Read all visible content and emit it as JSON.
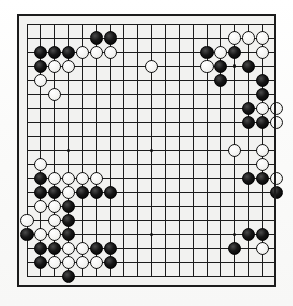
{
  "app": {
    "title": "Go Board Position",
    "board_type": "go-goban",
    "size": 19,
    "background_color": "#f2f2f0",
    "line_color": "#1c1c1c",
    "border_color": "#1c1c1c",
    "black_stone_color": "#000000",
    "white_stone_color": "#fbfbf9"
  },
  "geometry": {
    "board_left": 17,
    "board_top": 14,
    "board_width": 259,
    "board_height": 273,
    "origin_x": 10,
    "origin_y": 10,
    "cell_w": 13.85,
    "cell_h": 14.05,
    "stone_diameter": 13.2
  },
  "board": {
    "columns": 19,
    "rows": 19,
    "star_points": [
      {
        "col": 4,
        "row": 4
      },
      {
        "col": 10,
        "row": 4
      },
      {
        "col": 16,
        "row": 4
      },
      {
        "col": 4,
        "row": 10
      },
      {
        "col": 10,
        "row": 10
      },
      {
        "col": 16,
        "row": 10
      },
      {
        "col": 4,
        "row": 16
      },
      {
        "col": 10,
        "row": 16
      },
      {
        "col": 16,
        "row": 16
      }
    ],
    "stones": [
      {
        "col": 6,
        "row": 2,
        "color": "black"
      },
      {
        "col": 7,
        "row": 2,
        "color": "black"
      },
      {
        "col": 16,
        "row": 2,
        "color": "white"
      },
      {
        "col": 17,
        "row": 2,
        "color": "white"
      },
      {
        "col": 18,
        "row": 2,
        "color": "white"
      },
      {
        "col": 2,
        "row": 3,
        "color": "black"
      },
      {
        "col": 3,
        "row": 3,
        "color": "black"
      },
      {
        "col": 4,
        "row": 3,
        "color": "black"
      },
      {
        "col": 5,
        "row": 3,
        "color": "white"
      },
      {
        "col": 6,
        "row": 3,
        "color": "white"
      },
      {
        "col": 7,
        "row": 3,
        "color": "white"
      },
      {
        "col": 14,
        "row": 3,
        "color": "black"
      },
      {
        "col": 15,
        "row": 3,
        "color": "white"
      },
      {
        "col": 16,
        "row": 3,
        "color": "black"
      },
      {
        "col": 18,
        "row": 3,
        "color": "white"
      },
      {
        "col": 2,
        "row": 4,
        "color": "black"
      },
      {
        "col": 3,
        "row": 4,
        "color": "white"
      },
      {
        "col": 4,
        "row": 4,
        "color": "white"
      },
      {
        "col": 10,
        "row": 4,
        "color": "white"
      },
      {
        "col": 14,
        "row": 4,
        "color": "white"
      },
      {
        "col": 15,
        "row": 4,
        "color": "black"
      },
      {
        "col": 17,
        "row": 4,
        "color": "black"
      },
      {
        "col": 2,
        "row": 5,
        "color": "white"
      },
      {
        "col": 15,
        "row": 5,
        "color": "black"
      },
      {
        "col": 18,
        "row": 5,
        "color": "black"
      },
      {
        "col": 3,
        "row": 6,
        "color": "white"
      },
      {
        "col": 18,
        "row": 6,
        "color": "black"
      },
      {
        "col": 17,
        "row": 7,
        "color": "black"
      },
      {
        "col": 18,
        "row": 7,
        "color": "white"
      },
      {
        "col": 19,
        "row": 7,
        "color": "white"
      },
      {
        "col": 17,
        "row": 8,
        "color": "black"
      },
      {
        "col": 18,
        "row": 8,
        "color": "black"
      },
      {
        "col": 19,
        "row": 8,
        "color": "white"
      },
      {
        "col": 16,
        "row": 10,
        "color": "white"
      },
      {
        "col": 18,
        "row": 10,
        "color": "white"
      },
      {
        "col": 18,
        "row": 11,
        "color": "white"
      },
      {
        "col": 2,
        "row": 11,
        "color": "white"
      },
      {
        "col": 2,
        "row": 12,
        "color": "black"
      },
      {
        "col": 3,
        "row": 12,
        "color": "white"
      },
      {
        "col": 4,
        "row": 12,
        "color": "white"
      },
      {
        "col": 5,
        "row": 12,
        "color": "white"
      },
      {
        "col": 6,
        "row": 12,
        "color": "white"
      },
      {
        "col": 17,
        "row": 12,
        "color": "black"
      },
      {
        "col": 18,
        "row": 12,
        "color": "black"
      },
      {
        "col": 19,
        "row": 12,
        "color": "white"
      },
      {
        "col": 2,
        "row": 13,
        "color": "black"
      },
      {
        "col": 3,
        "row": 13,
        "color": "black"
      },
      {
        "col": 4,
        "row": 13,
        "color": "white"
      },
      {
        "col": 5,
        "row": 13,
        "color": "black"
      },
      {
        "col": 6,
        "row": 13,
        "color": "black"
      },
      {
        "col": 7,
        "row": 13,
        "color": "black"
      },
      {
        "col": 19,
        "row": 13,
        "color": "black"
      },
      {
        "col": 2,
        "row": 14,
        "color": "white"
      },
      {
        "col": 3,
        "row": 14,
        "color": "white"
      },
      {
        "col": 4,
        "row": 14,
        "color": "black"
      },
      {
        "col": 1,
        "row": 15,
        "color": "white"
      },
      {
        "col": 3,
        "row": 15,
        "color": "white"
      },
      {
        "col": 4,
        "row": 15,
        "color": "black"
      },
      {
        "col": 1,
        "row": 16,
        "color": "black"
      },
      {
        "col": 2,
        "row": 16,
        "color": "white"
      },
      {
        "col": 3,
        "row": 16,
        "color": "white"
      },
      {
        "col": 4,
        "row": 16,
        "color": "black"
      },
      {
        "col": 17,
        "row": 16,
        "color": "black"
      },
      {
        "col": 18,
        "row": 16,
        "color": "black"
      },
      {
        "col": 2,
        "row": 17,
        "color": "black"
      },
      {
        "col": 3,
        "row": 17,
        "color": "black"
      },
      {
        "col": 4,
        "row": 17,
        "color": "white"
      },
      {
        "col": 5,
        "row": 17,
        "color": "white"
      },
      {
        "col": 6,
        "row": 17,
        "color": "black"
      },
      {
        "col": 7,
        "row": 17,
        "color": "black"
      },
      {
        "col": 16,
        "row": 17,
        "color": "black"
      },
      {
        "col": 18,
        "row": 17,
        "color": "white"
      },
      {
        "col": 2,
        "row": 18,
        "color": "black"
      },
      {
        "col": 3,
        "row": 18,
        "color": "white"
      },
      {
        "col": 4,
        "row": 18,
        "color": "white"
      },
      {
        "col": 5,
        "row": 18,
        "color": "white"
      },
      {
        "col": 6,
        "row": 18,
        "color": "white"
      },
      {
        "col": 7,
        "row": 18,
        "color": "black"
      },
      {
        "col": 4,
        "row": 19,
        "color": "black"
      }
    ]
  }
}
